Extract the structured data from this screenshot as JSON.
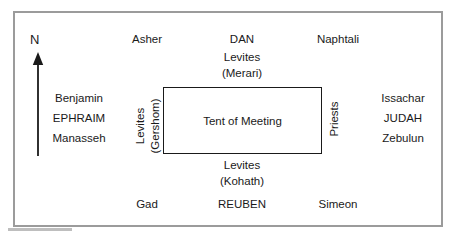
{
  "diagram": {
    "title_text": "Tent of Meeting",
    "compass": {
      "label": "N",
      "icon": "north-arrow-icon"
    },
    "north_side": {
      "tribes": [
        "Asher",
        "DAN",
        "Naphtali"
      ],
      "levites_line1": "Levites",
      "levites_line2": "(Merari)"
    },
    "south_side": {
      "tribes": [
        "Gad",
        "REUBEN",
        "Simeon"
      ],
      "levites_line1": "Levites",
      "levites_line2": "(Kohath)"
    },
    "west_side": {
      "tribes": [
        "Benjamin",
        "EPHRAIM",
        "Manasseh"
      ],
      "levites_line1": "Levites",
      "levites_line2": "(Gershom)"
    },
    "east_side": {
      "tribes": [
        "Issachar",
        "JUDAH",
        "Zebulun"
      ],
      "priests_label": "Priests"
    },
    "colors": {
      "frame": "#9b9b9b",
      "tent_border": "#1a1a1a",
      "text": "#1a1a1a",
      "background": "#ffffff"
    }
  }
}
